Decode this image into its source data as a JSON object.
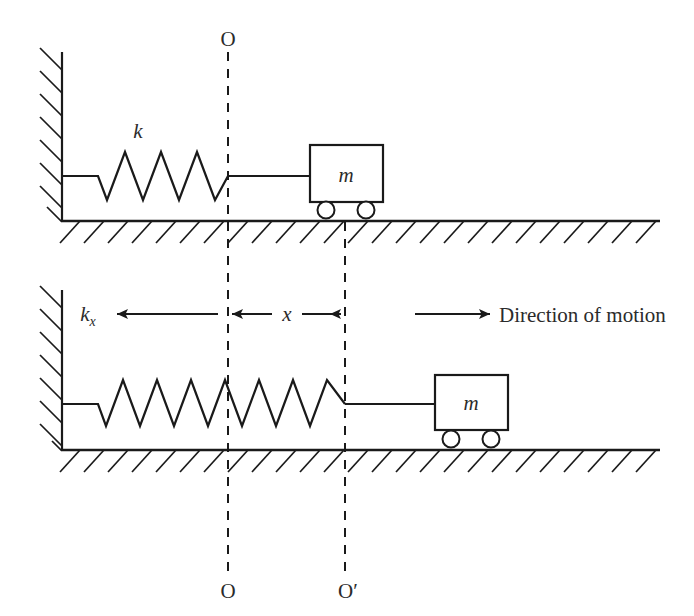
{
  "figure": {
    "background_color": "#ffffff",
    "line_color": "#1a1a1a",
    "text_color": "#2b2b2b"
  },
  "labels": {
    "spring_constant": "k",
    "spring_force": "k",
    "spring_force_subscript": "x",
    "mass_top": "m",
    "mass_bottom": "m",
    "origin_top": "O",
    "origin_bottom_left": "O",
    "origin_bottom_right": "O′",
    "displacement": "x",
    "direction_of_motion": "Direction of motion"
  },
  "panels": [
    {
      "name": "equilibrium-panel",
      "position": "top",
      "wall_x": 62,
      "ground_y": 221,
      "spring_start_x": 62,
      "spring_end_x": 228,
      "spring_coils": 3.5,
      "mass_box": {
        "x": 310,
        "y": 145,
        "width": 73,
        "height": 57
      },
      "wheels": 2,
      "reference_line_x": 228
    },
    {
      "name": "displaced-panel",
      "position": "bottom",
      "wall_x": 62,
      "ground_y": 450,
      "spring_start_x": 62,
      "spring_end_x": 345,
      "spring_coils": 7,
      "mass_box": {
        "x": 435,
        "y": 375,
        "width": 73,
        "height": 55
      },
      "wheels": 2,
      "reference_line_x": 345
    }
  ],
  "reference_lines": [
    {
      "name": "O-line",
      "x": 228,
      "label_top": "O",
      "label_bottom": "O"
    },
    {
      "name": "O-prime-line",
      "x": 345,
      "label_top": "",
      "label_bottom": "O′"
    }
  ],
  "arrows": [
    {
      "name": "spring-force-arrow",
      "direction": "left",
      "from_x": 218,
      "to_x": 117,
      "y": 314
    },
    {
      "name": "displacement-arrow",
      "direction": "both",
      "from_x": 228,
      "to_x": 345,
      "y": 314
    },
    {
      "name": "motion-arrow",
      "direction": "right",
      "from_x": 415,
      "to_x": 490,
      "y": 314
    }
  ]
}
